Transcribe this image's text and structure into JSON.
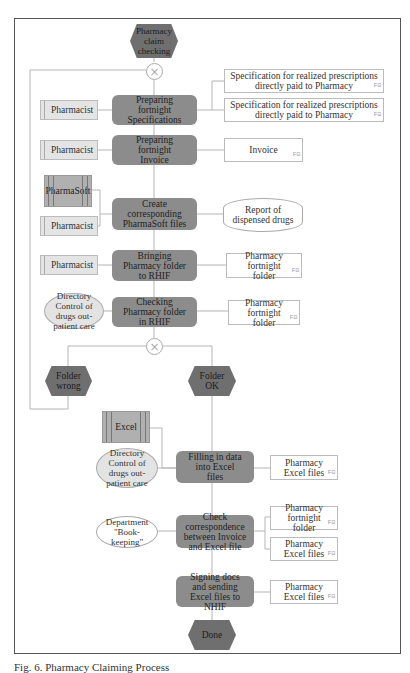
{
  "diagram": {
    "type": "EPC process diagram",
    "start_event": "Pharmacy claim checking",
    "end_event": "Done",
    "functions": [
      {
        "id": "f1",
        "label": "Preparing fortnight Specifications"
      },
      {
        "id": "f2",
        "label": "Preparing fortnight Invoice"
      },
      {
        "id": "f3",
        "label": "Create corresponding PharmaSoft  files"
      },
      {
        "id": "f4",
        "label": "Bringing Pharmacy folder to RHIF"
      },
      {
        "id": "f5",
        "label": "Checking Pharmacy folder in RHIF"
      },
      {
        "id": "f6",
        "label": "Filling in data into Excel files"
      },
      {
        "id": "f7",
        "label": "Check correspondence between Invoice and Excel file"
      },
      {
        "id": "f8",
        "label": "Signing docs and sending Excel files to NHIF"
      }
    ],
    "events": [
      {
        "id": "e_wrong",
        "label": "Folder wrong"
      },
      {
        "id": "e_ok",
        "label": "Folder OK"
      }
    ],
    "roles": [
      {
        "label": "Pharmacist"
      },
      {
        "label": "Pharmacist"
      },
      {
        "label": "Pharmacist"
      },
      {
        "label": "Pharmacist"
      }
    ],
    "systems": [
      {
        "label": "PharmaSoft"
      },
      {
        "label": "Excel"
      }
    ],
    "org_units": [
      {
        "label": "Directory Control of drugs out-patient care"
      },
      {
        "label": "Directory Control of drugs out-patient care"
      },
      {
        "label": "Department \"Book-keeping\""
      }
    ],
    "documents": [
      {
        "label": "Specification for realized prescriptions directly paid to Pharmacy"
      },
      {
        "label": "Specification for realized prescriptions directly paid to Pharmacy"
      },
      {
        "label": "Invoice"
      },
      {
        "label": "Pharmacy fortnight folder"
      },
      {
        "label": "Pharmacy fortnight folder"
      },
      {
        "label": "Pharmacy Excel files"
      },
      {
        "label": "Pharmacy fortnight folder"
      },
      {
        "label": "Pharmacy Excel files"
      },
      {
        "label": "Pharmacy Excel files"
      }
    ],
    "databases": [
      {
        "label": "Report of dispensed drugs"
      }
    ],
    "gateway_symbol": "×",
    "doc_tag": "F⊟"
  },
  "caption": "Fig. 6. Pharmacy Claiming Process"
}
